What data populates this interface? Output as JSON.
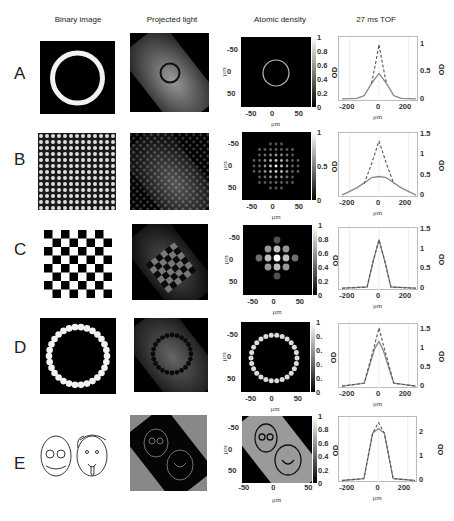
{
  "columns": {
    "binary": "Binary image",
    "projected": "Projected light",
    "density": "Atomic density",
    "tof": "27 ms TOF"
  },
  "rows": [
    {
      "label": "A",
      "pattern": "ring",
      "cbar_ticks": [
        "1",
        "0.8",
        "0.6",
        "0.4",
        "0.2",
        "0"
      ],
      "tof_ticks": [
        "1",
        "0.5",
        "0"
      ]
    },
    {
      "label": "B",
      "pattern": "lattice",
      "cbar_ticks": [
        "1",
        "0.5",
        "0"
      ],
      "tof_ticks": [
        "1.5",
        "1",
        "0.5",
        "0"
      ]
    },
    {
      "label": "C",
      "pattern": "checkerboard",
      "cbar_ticks": [
        "1",
        "0.8",
        "0.6",
        "0.4",
        "0.2",
        "0"
      ],
      "tof_ticks": [
        "1.5",
        "1",
        "0.5",
        "0"
      ]
    },
    {
      "label": "D",
      "pattern": "ring-of-dots",
      "cbar_ticks": [
        "1",
        "0.",
        "0.",
        "0.",
        "0.",
        "0"
      ],
      "tof_ticks": [
        "1.5",
        "1",
        "0.5",
        "0"
      ]
    },
    {
      "label": "E",
      "pattern": "portraits",
      "cbar_ticks": [
        "1",
        "0.8",
        "0.6",
        "0.4",
        "0.2",
        "0"
      ],
      "tof_ticks": [
        "2",
        "1",
        "0"
      ]
    }
  ],
  "axes": {
    "density_y_ticks": [
      "-50",
      "0",
      "50"
    ],
    "density_x_ticks": [
      "-50",
      "0",
      "50"
    ],
    "tof_x_ticks": [
      "-200",
      "0",
      "200"
    ],
    "unit": "μm",
    "od_label": "OD"
  },
  "chart_data": [
    {
      "type": "line",
      "title": "A 27 ms TOF",
      "xlabel": "μm",
      "ylabel": "OD",
      "xlim": [
        -270,
        270
      ],
      "ylim": [
        0,
        1.1
      ],
      "series": [
        {
          "name": "solid",
          "x": [
            -250,
            -150,
            -100,
            -50,
            0,
            50,
            100,
            150,
            250
          ],
          "values": [
            0.02,
            0.03,
            0.08,
            0.3,
            0.48,
            0.3,
            0.08,
            0.03,
            0.02
          ]
        },
        {
          "name": "dashed",
          "x": [
            -50,
            -20,
            0,
            20,
            50
          ],
          "values": [
            0.3,
            0.7,
            1.0,
            0.7,
            0.3
          ]
        }
      ]
    },
    {
      "type": "line",
      "title": "B 27 ms TOF",
      "xlabel": "μm",
      "ylabel": "OD",
      "xlim": [
        -270,
        270
      ],
      "ylim": [
        0,
        1.5
      ],
      "series": [
        {
          "name": "solid",
          "x": [
            -250,
            -150,
            -50,
            0,
            50,
            150,
            250
          ],
          "values": [
            0.02,
            0.2,
            0.45,
            0.48,
            0.45,
            0.2,
            0.02
          ]
        },
        {
          "name": "dashed",
          "x": [
            -100,
            -50,
            0,
            50,
            100
          ],
          "values": [
            0.3,
            0.8,
            1.35,
            0.8,
            0.3
          ]
        }
      ]
    },
    {
      "type": "line",
      "title": "C 27 ms TOF",
      "xlabel": "μm",
      "ylabel": "OD",
      "xlim": [
        -270,
        270
      ],
      "ylim": [
        0,
        1.5
      ],
      "series": [
        {
          "name": "solid",
          "x": [
            -250,
            -80,
            -40,
            0,
            40,
            80,
            250
          ],
          "values": [
            0.02,
            0.05,
            0.7,
            1.25,
            0.7,
            0.05,
            0.02
          ]
        },
        {
          "name": "dashed",
          "x": [
            -250,
            -80,
            -40,
            0,
            40,
            80,
            250
          ],
          "values": [
            0.02,
            0.05,
            0.7,
            1.25,
            0.7,
            0.05,
            0.02
          ]
        }
      ]
    },
    {
      "type": "line",
      "title": "D 27 ms TOF",
      "xlabel": "μm",
      "ylabel": "OD",
      "xlim": [
        -270,
        270
      ],
      "ylim": [
        0,
        1.6
      ],
      "series": [
        {
          "name": "solid",
          "x": [
            -250,
            -100,
            -30,
            0,
            30,
            100,
            250
          ],
          "values": [
            0.02,
            0.1,
            1.0,
            1.2,
            0.95,
            0.1,
            0.02
          ]
        },
        {
          "name": "dashed",
          "x": [
            -250,
            -100,
            -30,
            0,
            30,
            100,
            250
          ],
          "values": [
            0.02,
            0.1,
            1.1,
            1.55,
            1.1,
            0.1,
            0.02
          ]
        }
      ]
    },
    {
      "type": "line",
      "title": "E 27 ms TOF",
      "xlabel": "μm",
      "ylabel": "OD",
      "xlim": [
        -270,
        270
      ],
      "ylim": [
        0,
        2.6
      ],
      "series": [
        {
          "name": "solid",
          "x": [
            -250,
            -100,
            -40,
            0,
            40,
            100,
            250
          ],
          "values": [
            0.02,
            0.1,
            2.0,
            2.2,
            2.0,
            0.1,
            0.02
          ]
        },
        {
          "name": "dashed",
          "x": [
            -250,
            -100,
            -40,
            0,
            40,
            100,
            250
          ],
          "values": [
            0.02,
            0.1,
            2.0,
            2.45,
            2.0,
            0.1,
            0.02
          ]
        }
      ]
    }
  ]
}
